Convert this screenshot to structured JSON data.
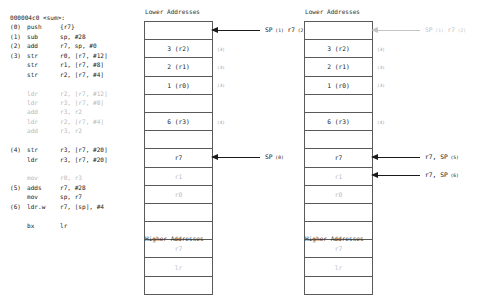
{
  "listing": {
    "title": "000004c0 <sum>:",
    "lines": [
      {
        "index": "",
        "mnemonic": "",
        "operands": "000004c0 <sum>:",
        "dim": false,
        "header": true
      },
      {
        "index": "(0)",
        "mnemonic": "push",
        "operands": "{r7}",
        "dim": false
      },
      {
        "index": "(1)",
        "mnemonic": "sub",
        "operands": "sp, #28",
        "dim": false
      },
      {
        "index": "(2)",
        "mnemonic": "add",
        "operands": "r7, sp, #0",
        "dim": false
      },
      {
        "index": "(3)",
        "mnemonic": "str",
        "operands": "r0, [r7, #12]",
        "dim": false
      },
      {
        "index": "",
        "mnemonic": "str",
        "operands": "r1, [r7, #8]",
        "dim": false
      },
      {
        "index": "",
        "mnemonic": "str",
        "operands": "r2, [r7, #4]",
        "dim": false
      },
      {
        "index": "",
        "mnemonic": "",
        "operands": "",
        "dim": false,
        "blank": true
      },
      {
        "index": "",
        "mnemonic": "ldr",
        "operands": "r2, [r7, #12]",
        "dim": true
      },
      {
        "index": "",
        "mnemonic": "ldr",
        "operands": "r3, [r7, #8]",
        "dim": true
      },
      {
        "index": "",
        "mnemonic": "add",
        "operands": "r3, r2",
        "dim": true
      },
      {
        "index": "",
        "mnemonic": "ldr",
        "operands": "r2, [r7, #4]",
        "dim": true
      },
      {
        "index": "",
        "mnemonic": "add",
        "operands": "r3, r2",
        "dim": true
      },
      {
        "index": "",
        "mnemonic": "",
        "operands": "",
        "dim": false,
        "blank": true
      },
      {
        "index": "(4)",
        "mnemonic": "str",
        "operands": "r3, [r7, #20]",
        "dim": false
      },
      {
        "index": "",
        "mnemonic": "ldr",
        "operands": "r3, [r7, #20]",
        "dim": false
      },
      {
        "index": "",
        "mnemonic": "",
        "operands": "",
        "dim": false,
        "blank": true
      },
      {
        "index": "",
        "mnemonic": "mov",
        "operands": "r0, r3",
        "dim": true
      },
      {
        "index": "(5)",
        "mnemonic": "adds",
        "operands": "r7, #28",
        "dim": false
      },
      {
        "index": "",
        "mnemonic": "mov",
        "operands": "sp, r7",
        "dim": false
      },
      {
        "index": "(6)",
        "mnemonic": "ldr.w",
        "operands": "r7, [sp], #4",
        "dim": false
      },
      {
        "index": "",
        "mnemonic": "",
        "operands": "",
        "dim": false,
        "blank": true
      },
      {
        "index": "",
        "mnemonic": "bx",
        "operands": "lr",
        "dim": false
      }
    ]
  },
  "diagrams": [
    {
      "id": "left",
      "top_label": "Lower Addresses",
      "bottom_label": "Higher Addresses",
      "cells": [
        {
          "text": "",
          "dim": false,
          "empty": true,
          "marker": ""
        },
        {
          "text": "3 (r2)",
          "dim": false,
          "empty": false,
          "marker": "(3)"
        },
        {
          "text": "2 (r1)",
          "dim": false,
          "empty": false,
          "marker": "(3)"
        },
        {
          "text": "1 (r0)",
          "dim": false,
          "empty": false,
          "marker": "(3)"
        },
        {
          "text": "",
          "dim": false,
          "empty": true,
          "marker": ""
        },
        {
          "text": "6 (r3)",
          "dim": false,
          "empty": false,
          "marker": "(4)"
        },
        {
          "text": "",
          "dim": false,
          "empty": true,
          "marker": ""
        },
        {
          "text": "r7",
          "dim": false,
          "empty": false,
          "marker": ""
        },
        {
          "text": "r1",
          "dim": true,
          "empty": false,
          "marker": ""
        },
        {
          "text": "r0",
          "dim": true,
          "empty": false,
          "marker": ""
        },
        {
          "text": "",
          "dim": false,
          "empty": true,
          "marker": ""
        },
        {
          "text": "",
          "dim": false,
          "empty": true,
          "marker": ""
        },
        {
          "text": "r7",
          "dim": true,
          "empty": false,
          "marker": ""
        },
        {
          "text": "lr",
          "dim": true,
          "empty": false,
          "marker": ""
        },
        {
          "text": "",
          "dim": false,
          "empty": true,
          "marker": ""
        }
      ],
      "annotations": [
        {
          "row": 0,
          "label": "SP",
          "sub": "(1)",
          "label2": "r7",
          "sub2": "(2)",
          "dim": false
        },
        {
          "row": 7,
          "label": "SP",
          "sub": "(0)",
          "label2": "",
          "sub2": "",
          "dim": false
        }
      ]
    },
    {
      "id": "right",
      "top_label": "Lower Addresses",
      "bottom_label": "Higher Addresses",
      "cells": [
        {
          "text": "",
          "dim": false,
          "empty": true,
          "marker": ""
        },
        {
          "text": "3 (r2)",
          "dim": false,
          "empty": false,
          "marker": "(3)"
        },
        {
          "text": "2 (r1)",
          "dim": false,
          "empty": false,
          "marker": "(3)"
        },
        {
          "text": "1 (r0)",
          "dim": false,
          "empty": false,
          "marker": "(3)"
        },
        {
          "text": "",
          "dim": false,
          "empty": true,
          "marker": ""
        },
        {
          "text": "6 (r3)",
          "dim": false,
          "empty": false,
          "marker": "(4)"
        },
        {
          "text": "",
          "dim": false,
          "empty": true,
          "marker": ""
        },
        {
          "text": "r7",
          "dim": false,
          "empty": false,
          "marker": ""
        },
        {
          "text": "r1",
          "dim": true,
          "empty": false,
          "marker": ""
        },
        {
          "text": "r0",
          "dim": true,
          "empty": false,
          "marker": ""
        },
        {
          "text": "",
          "dim": false,
          "empty": true,
          "marker": ""
        },
        {
          "text": "",
          "dim": false,
          "empty": true,
          "marker": ""
        },
        {
          "text": "r7",
          "dim": true,
          "empty": false,
          "marker": ""
        },
        {
          "text": "lr",
          "dim": true,
          "empty": false,
          "marker": ""
        },
        {
          "text": "",
          "dim": false,
          "empty": true,
          "marker": ""
        }
      ],
      "annotations": [
        {
          "row": 0,
          "label": "SP",
          "sub": "(1)",
          "label2": "r7",
          "sub2": "(2)",
          "dim": true
        },
        {
          "row": 7,
          "label": "r7, SP",
          "sub": "(5)",
          "label2": "",
          "sub2": "",
          "dim": false
        },
        {
          "row": 8,
          "label": "r7, SP",
          "sub": "(6)",
          "label2": "",
          "sub2": "",
          "dim": false
        }
      ]
    }
  ],
  "colors": {
    "ink": "#222222",
    "dim": "#bdbdbd",
    "rule": "#5a5a5a",
    "arrow": "#1a1a1a"
  }
}
